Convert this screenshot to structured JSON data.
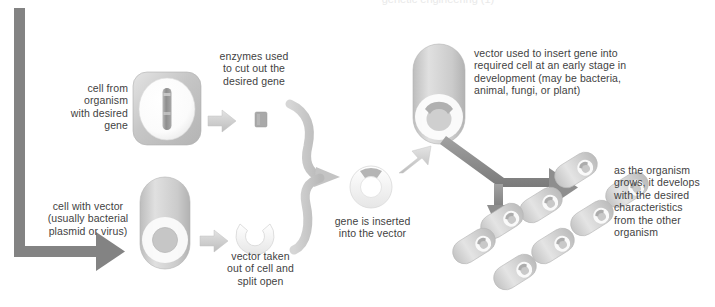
{
  "diagram": {
    "top_cut_text": "genetic engineering (1)",
    "labels": {
      "cell_from_organism": "cell from\norganism\nwith desired\ngene",
      "enzymes_used": "enzymes used\nto cut out the\ndesired gene",
      "cell_with_vector": "cell with vector\n(usually bacterial\nplasmid or virus)",
      "vector_taken_out": "vector taken\nout of cell and\nsplit open",
      "gene_inserted": "gene is inserted\ninto the vector",
      "vector_used_to_insert": "vector used to insert gene into\nrequired cell at an early stage in\ndevelopment (may be bacteria,\nanimal, fungi, or plant)",
      "as_the_organism_grows": "as the organism\ngrows, it develops\nwith the desired\ncharacteristics\nfrom the other\norganism"
    },
    "shapes": {
      "donor_cell": "rounded-square-cell-with-nucleus-and-chromosome",
      "gene_fragment": "small-gray-square-gene-block",
      "vector_cell": "capsule-bacterial-cell-with-plasmid-ring",
      "split_vector": "c-shaped-open-plasmid",
      "recombinant_vector": "ring-plasmid-with-gene-insert",
      "host_cell": "capsule-cell-with-recombinant-plasmid",
      "colony": "cluster-of-eight-bacterial-cells"
    },
    "colors": {
      "arrow_dark": "#848484",
      "arrow_light": "#d2d2d2",
      "cell_fill": "#c9c9c9",
      "cell_light": "#e2e2e2",
      "gene": "#a6a6a6",
      "text": "#3f3f3f",
      "white": "#ffffff"
    },
    "counts": {
      "colony_cells": 8
    }
  }
}
